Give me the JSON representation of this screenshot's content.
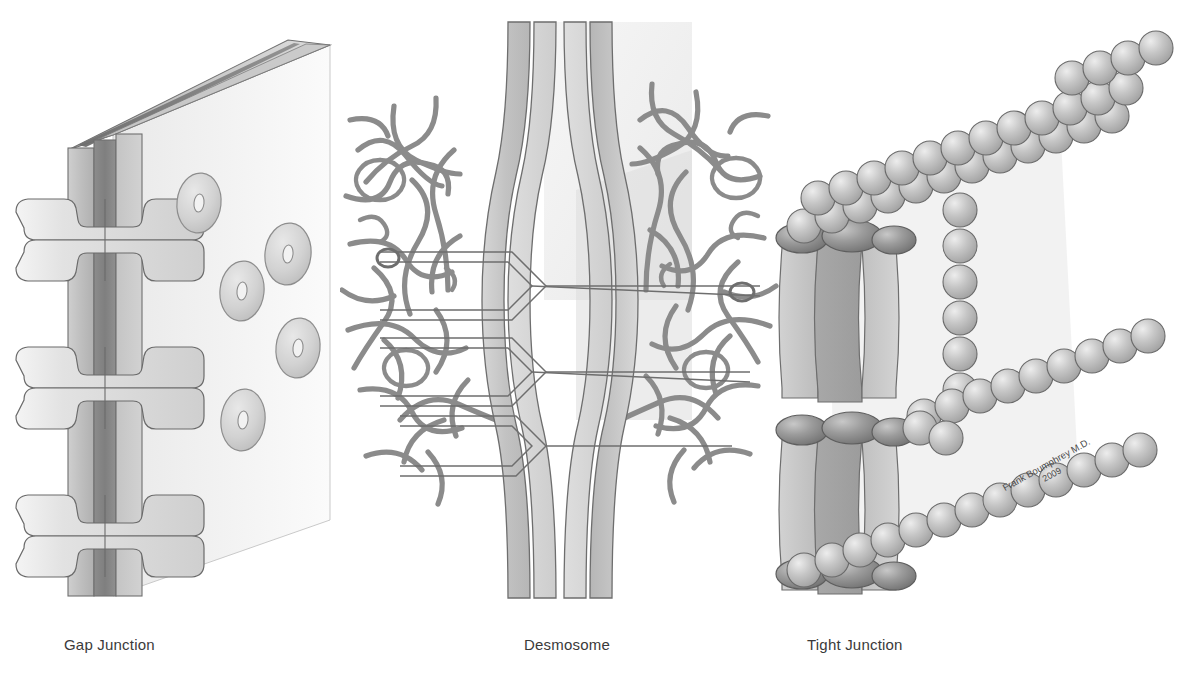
{
  "figure": {
    "background_color": "#ffffff",
    "width": 1194,
    "height": 687
  },
  "panels": [
    {
      "id": "gap-junction",
      "caption": "Gap Junction",
      "description": "Cut-away view of two apposed plasma membranes with connexon channels bridging the gap; membrane face shows oval connexons with central pores.",
      "elements": {
        "membrane_slab_label": "membrane slab",
        "connexon_pair_count": 3,
        "face_connexon_count": 6
      }
    },
    {
      "id": "desmosome",
      "caption": "Desmosome",
      "description": "Two hourglass-shaped plasma membranes joined by cadherin linkers across the intercellular space; dense plaques anchor tangled keratin intermediate filaments on both sides.",
      "elements": {
        "linker_count": 3,
        "filament_side_label": "keratin intermediate filaments"
      }
    },
    {
      "id": "tight-junction",
      "caption": "Tight Junction",
      "description": "Vertical sectioned membranes sealed by dark junction bands, with claudin/occludin strands drawn as chains of beads forming a sealing network.",
      "elements": {
        "seal_band_count": 3,
        "strand_count": 4
      }
    }
  ],
  "signature": {
    "author": "Frank Boumphrey M.D.",
    "year": "2009"
  },
  "colors": {
    "ink": "#3a3a3a",
    "outline": "#6e6e6e",
    "membrane_light": "#dcdcdc",
    "membrane_mid": "#c2c2c2",
    "membrane_dark": "#9a9a9a",
    "membrane_darkest": "#7d7d7d",
    "bead": "#b5b5b5",
    "bead_dark": "#8d8d8d",
    "filament": "#8a8a8a",
    "face_panel": "#ededed"
  }
}
